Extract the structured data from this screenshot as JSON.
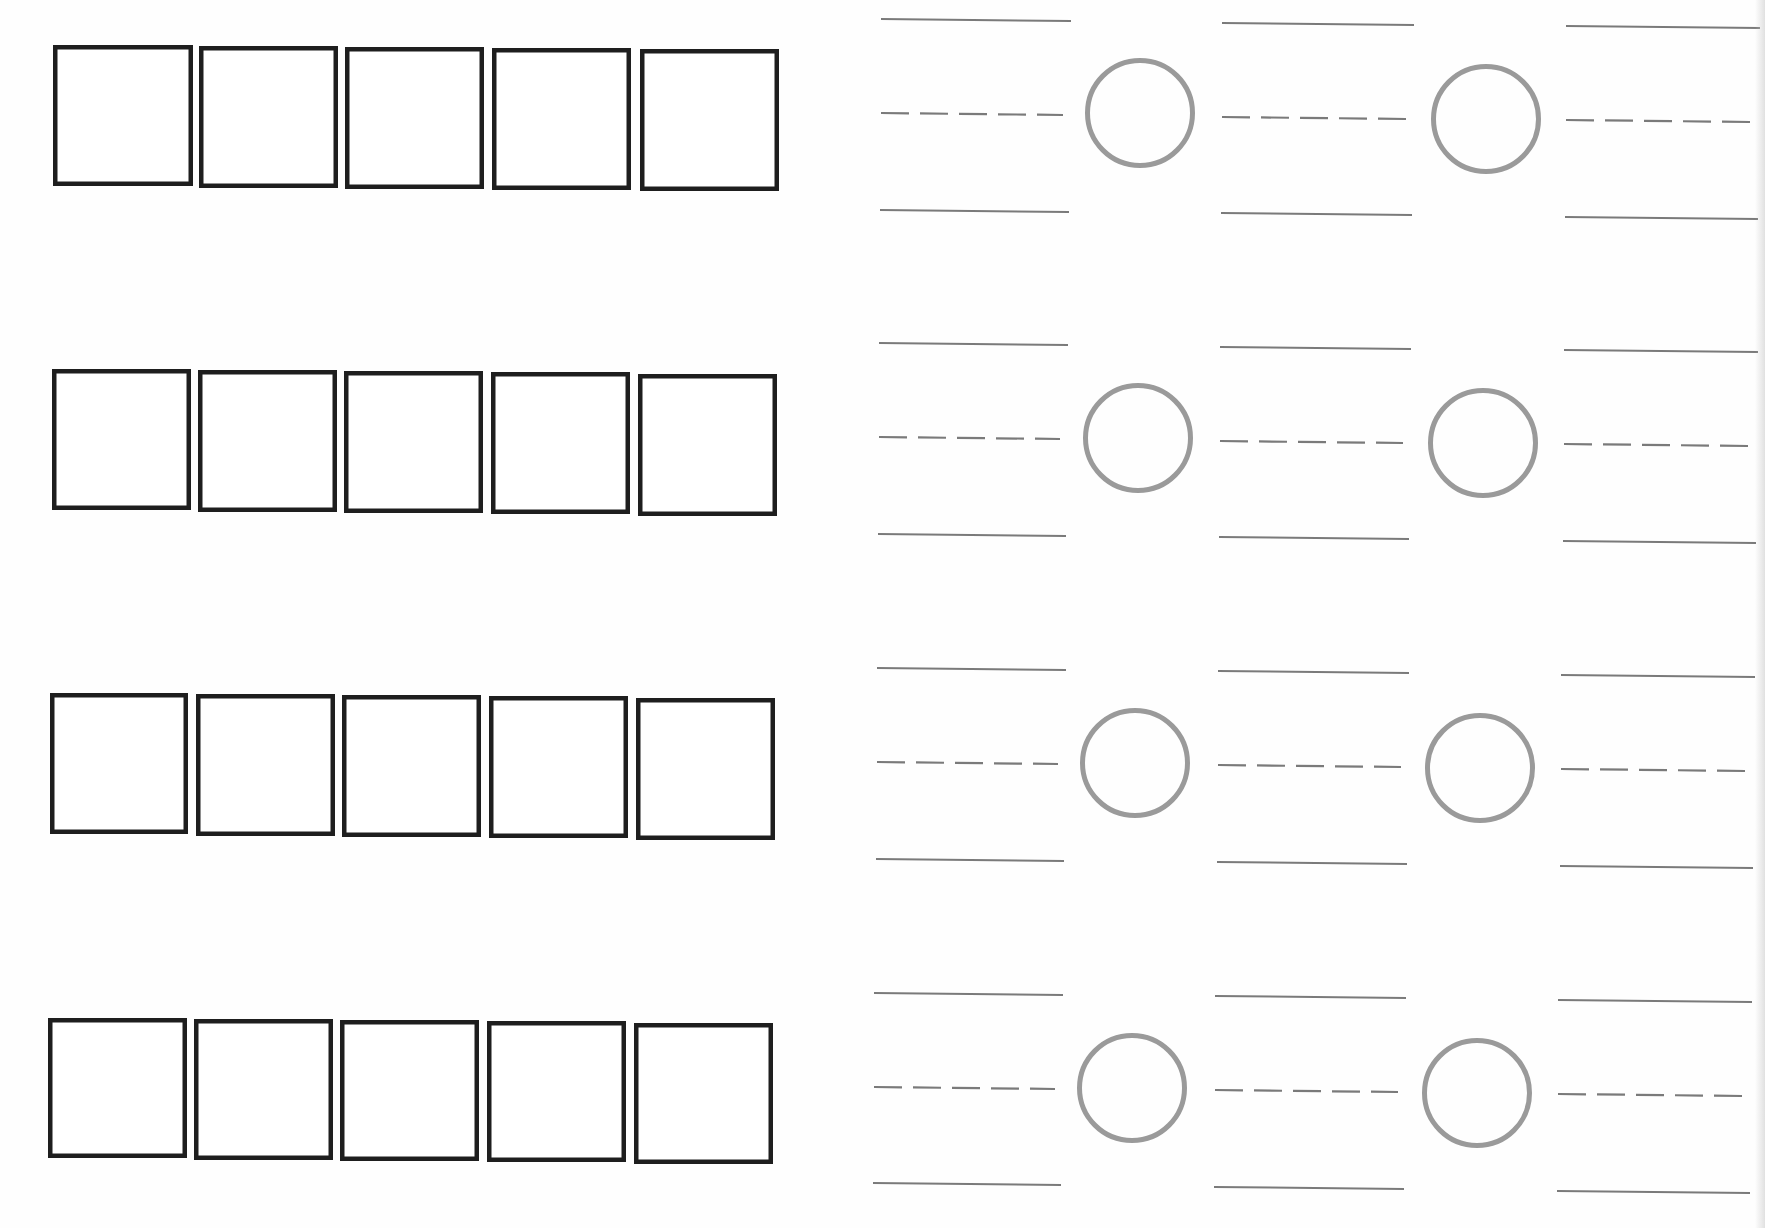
{
  "worksheet": {
    "colors": {
      "box_stroke": "#1e1e1e",
      "circle_stroke": "#9a9a9a",
      "line_stroke": "#7a7a7a",
      "background": "#fefefe"
    },
    "row_count": 4,
    "boxes_per_row": 5,
    "comparison_circles_per_row": 2,
    "answer_groups_per_row": 3,
    "rows": [
      {
        "index": 1,
        "boxes": [
          {
            "x": 53,
            "y": 45,
            "w": 140,
            "h": 141
          },
          {
            "x": 199,
            "y": 46,
            "w": 139,
            "h": 142
          },
          {
            "x": 345,
            "y": 47,
            "w": 139,
            "h": 142
          },
          {
            "x": 492,
            "y": 48,
            "w": 139,
            "h": 142
          },
          {
            "x": 640,
            "y": 49,
            "w": 139,
            "h": 142
          }
        ],
        "answer_groups": [
          {
            "x1": 881,
            "x2": 1071,
            "top_y": 19,
            "mid_y": 113,
            "bottom_y": 210
          },
          {
            "x1": 1222,
            "x2": 1414,
            "top_y": 23,
            "mid_y": 117,
            "bottom_y": 213
          },
          {
            "x1": 1566,
            "x2": 1760,
            "top_y": 26,
            "mid_y": 120,
            "bottom_y": 217
          }
        ],
        "circles": [
          {
            "cx": 1140,
            "cy": 113,
            "r": 55
          },
          {
            "cx": 1486,
            "cy": 119,
            "r": 55
          }
        ]
      },
      {
        "index": 2,
        "boxes": [
          {
            "x": 52,
            "y": 369,
            "w": 139,
            "h": 141
          },
          {
            "x": 198,
            "y": 370,
            "w": 139,
            "h": 142
          },
          {
            "x": 344,
            "y": 371,
            "w": 139,
            "h": 142
          },
          {
            "x": 491,
            "y": 372,
            "w": 139,
            "h": 142
          },
          {
            "x": 638,
            "y": 374,
            "w": 139,
            "h": 142
          }
        ],
        "answer_groups": [
          {
            "x1": 879,
            "x2": 1068,
            "top_y": 343,
            "mid_y": 437,
            "bottom_y": 534
          },
          {
            "x1": 1220,
            "x2": 1411,
            "top_y": 347,
            "mid_y": 441,
            "bottom_y": 537
          },
          {
            "x1": 1564,
            "x2": 1758,
            "top_y": 350,
            "mid_y": 444,
            "bottom_y": 541
          }
        ],
        "circles": [
          {
            "cx": 1138,
            "cy": 438,
            "r": 55
          },
          {
            "cx": 1483,
            "cy": 443,
            "r": 55
          }
        ]
      },
      {
        "index": 3,
        "boxes": [
          {
            "x": 50,
            "y": 693,
            "w": 138,
            "h": 141
          },
          {
            "x": 196,
            "y": 694,
            "w": 139,
            "h": 142
          },
          {
            "x": 342,
            "y": 695,
            "w": 139,
            "h": 142
          },
          {
            "x": 489,
            "y": 696,
            "w": 139,
            "h": 142
          },
          {
            "x": 636,
            "y": 698,
            "w": 139,
            "h": 142
          }
        ],
        "answer_groups": [
          {
            "x1": 877,
            "x2": 1066,
            "top_y": 668,
            "mid_y": 762,
            "bottom_y": 859
          },
          {
            "x1": 1218,
            "x2": 1409,
            "top_y": 671,
            "mid_y": 765,
            "bottom_y": 862
          },
          {
            "x1": 1561,
            "x2": 1755,
            "top_y": 675,
            "mid_y": 769,
            "bottom_y": 866
          }
        ],
        "circles": [
          {
            "cx": 1135,
            "cy": 763,
            "r": 55
          },
          {
            "cx": 1480,
            "cy": 768,
            "r": 55
          }
        ]
      },
      {
        "index": 4,
        "boxes": [
          {
            "x": 48,
            "y": 1018,
            "w": 139,
            "h": 140
          },
          {
            "x": 194,
            "y": 1019,
            "w": 139,
            "h": 141
          },
          {
            "x": 340,
            "y": 1020,
            "w": 139,
            "h": 141
          },
          {
            "x": 487,
            "y": 1021,
            "w": 139,
            "h": 141
          },
          {
            "x": 634,
            "y": 1023,
            "w": 139,
            "h": 141
          }
        ],
        "answer_groups": [
          {
            "x1": 874,
            "x2": 1063,
            "top_y": 993,
            "mid_y": 1087,
            "bottom_y": 1183
          },
          {
            "x1": 1215,
            "x2": 1406,
            "top_y": 996,
            "mid_y": 1090,
            "bottom_y": 1187
          },
          {
            "x1": 1558,
            "x2": 1752,
            "top_y": 1000,
            "mid_y": 1094,
            "bottom_y": 1191
          }
        ],
        "circles": [
          {
            "cx": 1132,
            "cy": 1088,
            "r": 55
          },
          {
            "cx": 1477,
            "cy": 1093,
            "r": 55
          }
        ]
      }
    ]
  }
}
